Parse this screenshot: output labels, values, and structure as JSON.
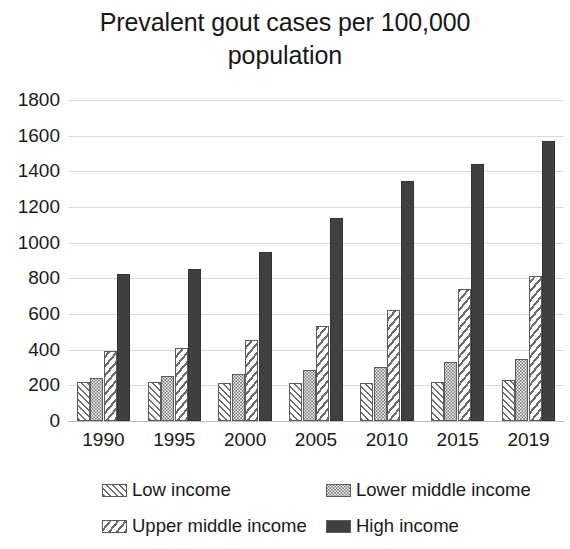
{
  "chart_data": {
    "type": "bar",
    "title": "Prevalent gout cases per 100,000 population",
    "title_line1": "Prevalent gout cases per 100,000",
    "title_line2": "population",
    "xlabel": "",
    "ylabel": "",
    "ylim": [
      0,
      1800
    ],
    "ytick_step": 200,
    "grid": true,
    "grid_axis": "y",
    "legend_position": "bottom",
    "categories": [
      "1990",
      "1995",
      "2000",
      "2005",
      "2010",
      "2015",
      "2019"
    ],
    "yticks": [
      "0",
      "200",
      "400",
      "600",
      "800",
      "1000",
      "1200",
      "1400",
      "1600",
      "1800"
    ],
    "ytick_values": [
      0,
      200,
      400,
      600,
      800,
      1000,
      1200,
      1400,
      1600,
      1800
    ],
    "series": [
      {
        "name": "Low income",
        "pattern": "forward-diagonal-hatch",
        "color": "#6e6e6e",
        "values": [
          220,
          220,
          215,
          215,
          215,
          220,
          230
        ]
      },
      {
        "name": "Lower middle income",
        "pattern": "dotted-stipple",
        "color": "#7a7a7a",
        "values": [
          240,
          250,
          265,
          285,
          305,
          330,
          345
        ]
      },
      {
        "name": "Upper middle income",
        "pattern": "back-diagonal-hatch",
        "color": "#6b6b6b",
        "values": [
          395,
          410,
          455,
          535,
          625,
          740,
          815
        ]
      },
      {
        "name": "High income",
        "pattern": "solid",
        "color": "#404040",
        "values": [
          825,
          855,
          945,
          1140,
          1345,
          1440,
          1570
        ]
      }
    ]
  },
  "legend": {
    "items": [
      {
        "label": "Low income"
      },
      {
        "label": "Lower middle income"
      },
      {
        "label": "Upper middle income"
      },
      {
        "label": "High income"
      }
    ]
  },
  "colors": {
    "gridline": "#d9d9d9",
    "axis": "#bfbfbf",
    "text": "#1a1a1a",
    "background": "#ffffff",
    "high_income": "#404040"
  }
}
